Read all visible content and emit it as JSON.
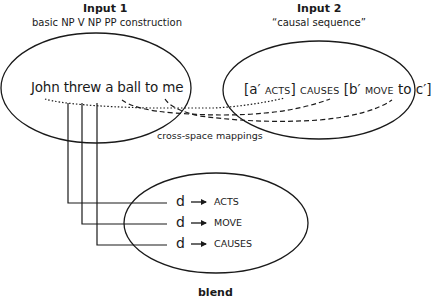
{
  "input1": {
    "title": "Input 1",
    "subtitle": "basic NP V NP PP construction",
    "sentence": "John threw a ball to me"
  },
  "input2": {
    "title": "Input 2",
    "subtitle": "“causal sequence”",
    "schema": {
      "p1": "[a′ ",
      "p2": "ACTS",
      "p3": "] ",
      "p4": "CAUSES",
      "p5": " [b′ ",
      "p6": "MOVE",
      "p7": " to c′]"
    }
  },
  "mappings_label": "cross-space mappings",
  "blend": {
    "label": "blend",
    "rows": [
      {
        "var": "d",
        "arrow": "→",
        "role": "ACTS"
      },
      {
        "var": "d",
        "arrow": "→",
        "role": "MOVE"
      },
      {
        "var": "d",
        "arrow": "→",
        "role": "CAUSES"
      }
    ]
  }
}
